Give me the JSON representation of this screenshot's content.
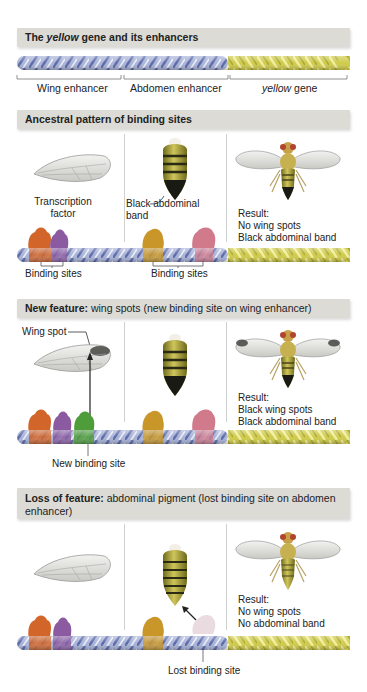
{
  "header": {
    "title_pre": "The ",
    "title_italic": "yellow",
    "title_post": " gene and its enhancers"
  },
  "gene_map": {
    "segments": [
      {
        "label": "Wing enhancer",
        "color": "#9aa6cf"
      },
      {
        "label": "Abdomen enhancer",
        "color": "#9aa6cf"
      },
      {
        "label_italic": "yellow",
        "label_post": " gene",
        "color": "#c9c648"
      }
    ]
  },
  "panels": [
    {
      "title_bold": "Ancestral pattern of binding sites",
      "title_rest": "",
      "labels": {
        "transcription_factor": "Transcription factor",
        "abdomen": "Black abdominal band",
        "binding_sites_left": "Binding sites",
        "binding_sites_right": "Binding sites"
      },
      "result": [
        "Result:",
        "No wing spots",
        "Black abdominal band"
      ]
    },
    {
      "title_bold": "New feature:",
      "title_rest": " wing spots (new binding site on wing enhancer)",
      "labels": {
        "wing_spot": "Wing spot",
        "new_site": "New binding site"
      },
      "result": [
        "Result:",
        "Black wing spots",
        "Black abdominal band"
      ]
    },
    {
      "title_bold": "Loss of feature:",
      "title_rest": " abdominal pigment (lost binding site on abdomen enhancer)",
      "labels": {
        "lost_site": "Lost binding site"
      },
      "result": [
        "Result:",
        "No wing spots",
        "No abdominal band"
      ]
    }
  ],
  "colors": {
    "header_bg": "#dcdbd6",
    "enhancer_dna": "#9aa6cf",
    "gene_dna": "#c9c648",
    "tf_orange": "#d2662a",
    "tf_purple": "#8b5aa0",
    "tf_green": "#4f9d3a",
    "tf_gold": "#c9962a",
    "tf_pink": "#d07a8c",
    "tf_lost": "#eadbe0"
  }
}
